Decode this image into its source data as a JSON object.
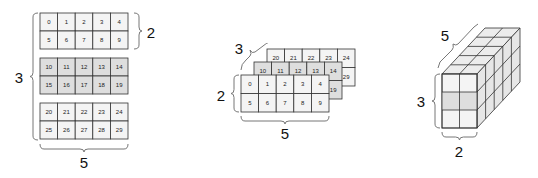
{
  "diagram": {
    "colors": {
      "cell_fill_light": "#f4f4f4",
      "cell_fill_shaded": "#dedede",
      "grid_stroke": "#333333",
      "brace_stroke": "#777777",
      "text": "#111111"
    },
    "panel_left": {
      "name": "stacked-blocks",
      "blocks": [
        {
          "shaded": false,
          "rows": [
            [
              0,
              1,
              2,
              3,
              4
            ],
            [
              5,
              6,
              7,
              8,
              9
            ]
          ]
        },
        {
          "shaded": true,
          "rows": [
            [
              10,
              11,
              12,
              13,
              14
            ],
            [
              15,
              16,
              17,
              18,
              19
            ]
          ]
        },
        {
          "shaded": false,
          "rows": [
            [
              20,
              21,
              22,
              23,
              24
            ],
            [
              25,
              26,
              27,
              28,
              29
            ]
          ]
        }
      ],
      "labels": {
        "blocks": "3",
        "rows": "2",
        "cols": "5"
      }
    },
    "panel_middle": {
      "name": "layered-slabs",
      "slabs_back_to_front": [
        {
          "rows": [
            [
              20,
              21,
              22,
              23,
              24
            ],
            [
              25,
              26,
              27,
              28,
              29
            ]
          ]
        },
        {
          "rows": [
            [
              10,
              11,
              12,
              13,
              14
            ],
            [
              15,
              16,
              17,
              18,
              19
            ]
          ]
        },
        {
          "rows": [
            [
              0,
              1,
              2,
              3,
              4
            ],
            [
              5,
              6,
              7,
              8,
              9
            ]
          ]
        }
      ],
      "labels": {
        "depth": "3",
        "rows": "2",
        "cols": "5"
      }
    },
    "panel_right": {
      "name": "3d-cube",
      "dims": {
        "height": 3,
        "width": 2,
        "depth": 5
      },
      "labels": {
        "depth": "5",
        "height": "3",
        "width": "2"
      }
    }
  }
}
